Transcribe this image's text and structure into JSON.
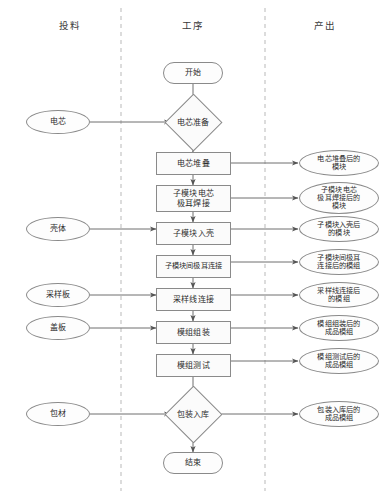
{
  "diagram": {
    "type": "swimlane-flowchart",
    "orientation": "vertical",
    "columns": [
      {
        "id": "input",
        "header": "投料"
      },
      {
        "id": "process",
        "header": "工序"
      },
      {
        "id": "output",
        "header": "产出"
      }
    ],
    "colors": {
      "node_stroke": "#8a8a8a",
      "node_fill": "#fbfbfb",
      "connector": "#6e6e6e",
      "divider": "#b9b9b9",
      "text": "#2b2b2b"
    },
    "start_node": {
      "label": "开始",
      "shape": "terminator"
    },
    "end_node": {
      "label": "结束",
      "shape": "terminator"
    },
    "decisions": [
      {
        "id": "d1",
        "label": "电芯准备",
        "shape": "diamond"
      },
      {
        "id": "d2",
        "label": "包装入库",
        "shape": "diamond"
      }
    ],
    "process_steps": [
      {
        "id": "p1",
        "label": "电芯堆叠",
        "shape": "process"
      },
      {
        "id": "p2",
        "label": "子模块电芯\n极耳焊接",
        "line1": "子模块电芯",
        "line2": "极耳焊接",
        "shape": "process"
      },
      {
        "id": "p3",
        "label": "子模块入壳",
        "shape": "process"
      },
      {
        "id": "p4",
        "label": "子模块间极耳连接",
        "shape": "process"
      },
      {
        "id": "p5",
        "label": "采样线连接",
        "shape": "process"
      },
      {
        "id": "p6",
        "label": "模组组装",
        "shape": "process"
      },
      {
        "id": "p7",
        "label": "模组测试",
        "shape": "process"
      }
    ],
    "inputs": [
      {
        "id": "i1",
        "label": "电芯",
        "target": "电芯准备"
      },
      {
        "id": "i2",
        "label": "壳体",
        "target": "子模块入壳"
      },
      {
        "id": "i3",
        "label": "采样板",
        "target": "采样线连接"
      },
      {
        "id": "i4",
        "label": "盖板",
        "target": "模组组装"
      },
      {
        "id": "i5",
        "label": "包材",
        "target": "包装入库"
      }
    ],
    "outputs": [
      {
        "id": "o1",
        "line1": "电芯堆叠后的",
        "line2": "模块",
        "source": "电芯堆叠"
      },
      {
        "id": "o2",
        "line1": "子模块电芯",
        "line2": "极耳焊接后的",
        "line3": "模块",
        "source": "子模块电芯极耳焊接"
      },
      {
        "id": "o3",
        "line1": "子模块入壳后",
        "line2": "的模块",
        "source": "子模块入壳"
      },
      {
        "id": "o4",
        "line1": "子模块间极耳",
        "line2": "连接后的模组",
        "source": "子模块间极耳连接"
      },
      {
        "id": "o5",
        "line1": "采样线连接后",
        "line2": "的模组",
        "source": "采样线连接"
      },
      {
        "id": "o6",
        "line1": "模组组装后的",
        "line2": "成品模组",
        "source": "模组组装"
      },
      {
        "id": "o7",
        "line1": "模组测试后的",
        "line2": "成品模组",
        "source": "模组测试"
      },
      {
        "id": "o8",
        "line1": "包装入库后的",
        "line2": "成品模组",
        "source": "包装入库"
      }
    ]
  }
}
